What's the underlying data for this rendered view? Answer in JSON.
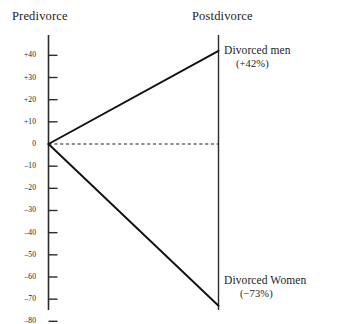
{
  "figure": {
    "left_header": "Predivorce",
    "right_header": "Postdivorce"
  },
  "labels": {
    "men_name": "Divorced men",
    "men_value": "(+42%)",
    "women_name": "Divorced Women",
    "women_value": "(−73%)"
  },
  "axis": {
    "ticks": [
      "+40",
      "+30",
      "+20",
      "+10",
      "0",
      "–10",
      "–20",
      "–30",
      "–40",
      "–50",
      "–60",
      "–70",
      "–80"
    ]
  },
  "colors": {
    "ink": "#1a1a1a",
    "axis": "#2b2b2b",
    "background": "#ffffff"
  },
  "chart_data": {
    "type": "line",
    "title": "",
    "subtitle": "",
    "xlabel": "",
    "ylabel": "",
    "x": [
      "Predivorce",
      "Postdivorce"
    ],
    "categories": [
      "Predivorce",
      "Postdivorce"
    ],
    "series": [
      {
        "name": "Divorced men",
        "values": [
          0,
          42
        ],
        "end_label": "(+42%)"
      },
      {
        "name": "Divorced Women",
        "values": [
          0,
          -73
        ],
        "end_label": "(−73%)"
      }
    ],
    "ylim": [
      -80,
      45
    ],
    "yticks": [
      40,
      30,
      20,
      10,
      0,
      -10,
      -20,
      -30,
      -40,
      -50,
      -60,
      -70,
      -80
    ],
    "ytick_labels": [
      "+40",
      "+30",
      "+20",
      "+10",
      "0",
      "–10",
      "–20",
      "–30",
      "–40",
      "–50",
      "–60",
      "–70",
      "–80"
    ],
    "grid": false,
    "legend": "none",
    "annotations": [
      {
        "text": "Divorced men",
        "x": "Postdivorce",
        "y": 42
      },
      {
        "text": "(+42%)",
        "x": "Postdivorce",
        "y": 42
      },
      {
        "text": "Divorced Women",
        "x": "Postdivorce",
        "y": -73
      },
      {
        "text": "(−73%)",
        "x": "Postdivorce",
        "y": -73
      }
    ],
    "reference_lines": [
      {
        "y": 0,
        "style": "dashed"
      }
    ]
  }
}
